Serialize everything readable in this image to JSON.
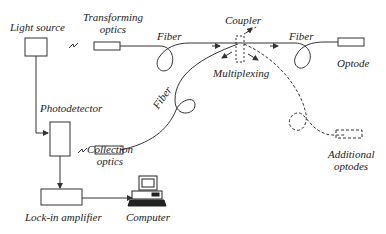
{
  "diagram": {
    "type": "fiber-optic sensor system schematic",
    "labels": {
      "light_source": "Light source",
      "transforming_optics_1": "Transforming",
      "transforming_optics_2": "optics",
      "fiber_top": "Fiber",
      "coupler": "Coupler",
      "fiber_right": "Fiber",
      "optode": "Optode",
      "multiplexing": "Multiplexing",
      "fiber_diag": "Fiber",
      "photodetector": "Photodetector",
      "collection_optics_1": "Collection",
      "collection_optics_2": "optics",
      "additional_optodes_1": "Additional",
      "additional_optodes_2": "optodes",
      "lock_in_amplifier": "Lock-in amplifier",
      "computer": "Computer"
    },
    "colors": {
      "stroke": "#333333",
      "text": "#222222",
      "background": "#ffffff"
    }
  }
}
